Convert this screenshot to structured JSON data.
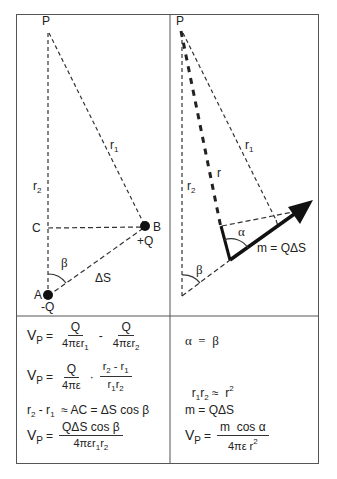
{
  "left_diagram": {
    "labels": {
      "P": "P",
      "r1": "r",
      "r1_sub": "1",
      "r2": "r",
      "r2_sub": "2",
      "C": "C",
      "B": "B",
      "plusQ": "+Q",
      "A": "A",
      "minusQ": "-Q",
      "beta": "β",
      "deltaS": "ΔS"
    }
  },
  "right_diagram": {
    "labels": {
      "P": "P",
      "r": "r",
      "r1": "r",
      "r1_sub": "1",
      "r2": "r",
      "r2_sub": "2",
      "alpha": "α",
      "beta": "β",
      "moment": "m = QΔS"
    }
  },
  "left_equations": {
    "eq1": {
      "lhs": "V",
      "lhs_sub": "P",
      "eq": "=",
      "f1_num": "Q",
      "f1_den": "4πεr",
      "f1_den_sub": "1",
      "op": "-",
      "f2_num": "Q",
      "f2_den": "4πεr",
      "f2_den_sub": "2"
    },
    "eq2": {
      "lhs": "V",
      "lhs_sub": "P",
      "eq": "=",
      "f1_num": "Q",
      "f1_den": "4πε",
      "op": "·",
      "f2_num_a": "r",
      "f2_num_a_sub": "2",
      "f2_num_mid": " - r",
      "f2_num_b_sub": "1",
      "f2_den_a": "r",
      "f2_den_a_sub": "1",
      "f2_den_b": "r",
      "f2_den_b_sub": "2"
    },
    "eq3": {
      "a": "r",
      "a_sub": "2",
      "mid": " - r",
      "b_sub": "1",
      "rest": "  ≈ AC = ΔS cos β"
    },
    "eq4": {
      "lhs": "V",
      "lhs_sub": "P",
      "eq": "=",
      "num": "QΔS cos β",
      "den": "4πεr",
      "den_sub1": "1",
      "den_mid": "r",
      "den_sub2": "2"
    }
  },
  "right_equations": {
    "eq1": "α  =  β",
    "eq2": {
      "a": "r",
      "a_sub": "1",
      "b": "r",
      "b_sub": "2",
      "rel": " ≈  r",
      "sup": "2"
    },
    "eq3": "m = QΔS",
    "eq4": {
      "lhs": "V",
      "lhs_sub": "P",
      "eq": "=",
      "num": "m  cos α",
      "den": "4πε r",
      "den_sup": "2"
    }
  }
}
